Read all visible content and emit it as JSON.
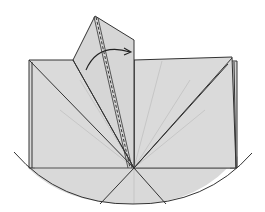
{
  "diagram": {
    "type": "origami-fold-step",
    "colors": {
      "paper": "#d9d9d9",
      "edge": "#333333",
      "crease": "#b0b0b0",
      "arrow": "#222222",
      "background": "#ffffff"
    },
    "elements": [
      {
        "id": "base-square",
        "label": "folded paper base"
      },
      {
        "id": "raised-flap",
        "label": "raised flap"
      },
      {
        "id": "fold-arrow",
        "label": "fold arrow"
      },
      {
        "id": "valley-fold-line",
        "label": "dashed valley fold line"
      },
      {
        "id": "bottom-arc",
        "label": "curved bottom edge"
      }
    ]
  }
}
